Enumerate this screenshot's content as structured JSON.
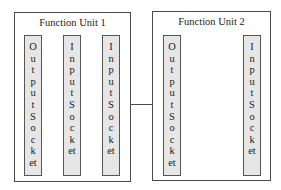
{
  "diagram": {
    "units": [
      {
        "title": "Function Unit 1",
        "sockets": [
          {
            "type": "output",
            "label": "OutputSocket",
            "chars": [
              "O",
              "u",
              "t",
              "p",
              "u",
              "t",
              "S",
              "o",
              "c",
              "k",
              "et"
            ]
          },
          {
            "type": "input",
            "label": "InputSocket",
            "chars": [
              "I",
              "n",
              "p",
              "u",
              "t",
              "S",
              "o",
              "c",
              "k",
              "et"
            ]
          },
          {
            "type": "input",
            "label": "InputSocket",
            "chars": [
              "I",
              "n",
              "p",
              "u",
              "t",
              "S",
              "o",
              "c",
              "k",
              "et"
            ]
          }
        ]
      },
      {
        "title": "Function Unit 2",
        "sockets": [
          {
            "type": "output",
            "label": "OutputSocket",
            "chars": [
              "O",
              "u",
              "t",
              "p",
              "u",
              "t",
              "S",
              "o",
              "c",
              "k",
              "et"
            ]
          },
          {
            "type": "input",
            "label": "InputSocket",
            "chars": [
              "I",
              "n",
              "p",
              "u",
              "t",
              "S",
              "o",
              "c",
              "k",
              "et"
            ]
          }
        ]
      }
    ],
    "connections": [
      {
        "from": "Function Unit 1",
        "to": "Function Unit 2"
      }
    ],
    "colors": {
      "border": "#4a4a4a",
      "socket_fill": "#e6e6e6",
      "background": "#ffffff"
    }
  }
}
